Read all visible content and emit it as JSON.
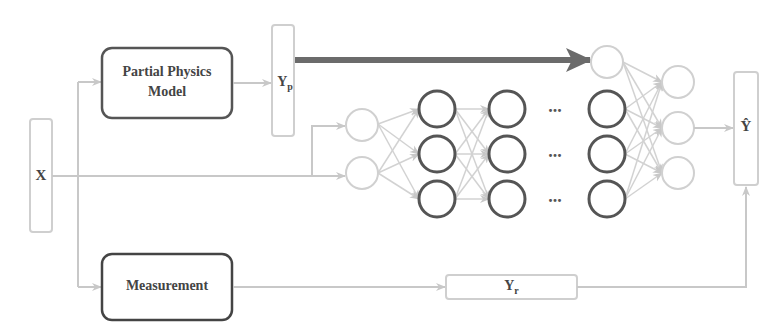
{
  "diagram": {
    "title": "",
    "nodes": {
      "input": {
        "label": "X"
      },
      "physics_model": {
        "label_line1": "Partial Physics",
        "label_line2": "Model"
      },
      "physics_output": {
        "label": "Y",
        "subscript": "p"
      },
      "measurement": {
        "label": "Measurement"
      },
      "residual": {
        "label": "Y",
        "subscript": "r"
      },
      "prediction": {
        "label": "Ŷ"
      }
    },
    "neural_network": {
      "input_layer_neurons": 2,
      "hidden_layer_neurons": 3,
      "visible_hidden_layers": 3,
      "ellipsis": "...",
      "output_layer_neurons": 3,
      "injected_neuron": 1
    },
    "colors": {
      "dark_stroke": "#555555",
      "light_stroke": "#c8c8c8",
      "thick_arrow": "#6b6b6b",
      "text": "#444444"
    }
  }
}
